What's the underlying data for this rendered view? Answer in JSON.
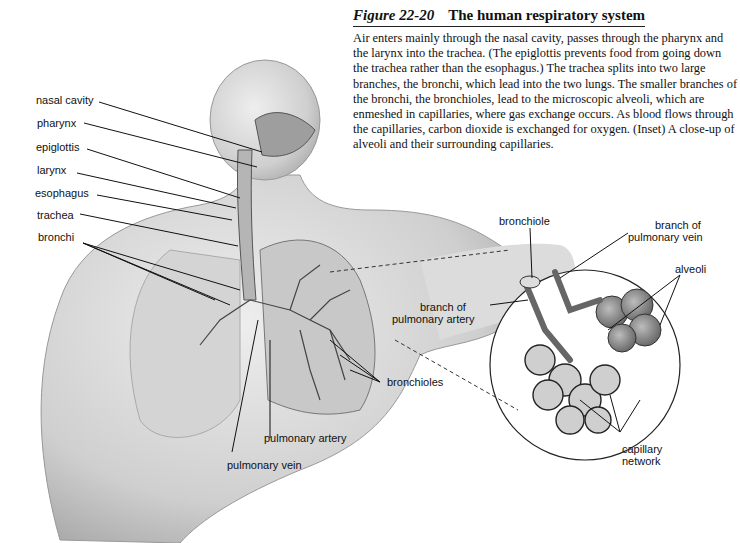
{
  "figure": {
    "number": "Figure 22-20",
    "title": "The human respiratory system",
    "caption": "Air enters mainly through the nasal cavity, passes through the pharynx and the larynx into the trachea. (The epiglottis prevents food from going down the trachea rather than the esophagus.) The trachea splits into two large branches, the bronchi, which lead into the two lungs. The smaller branches of the bronchi, the bronchioles, lead to the microscopic alveoli, which are enmeshed in capillaries, where gas exchange occurs. As blood flows through the capillaries, carbon dioxide is exchanged for oxygen. (Inset) A close-up of alveoli and their surrounding capillaries."
  },
  "labels": {
    "nasal_cavity": "nasal cavity",
    "pharynx": "pharynx",
    "epiglottis": "epiglottis",
    "larynx": "larynx",
    "esophagus": "esophagus",
    "trachea": "trachea",
    "bronchi": "bronchi",
    "bronchioles": "bronchioles",
    "pulmonary_artery": "pulmonary artery",
    "pulmonary_vein": "pulmonary vein"
  },
  "inset_labels": {
    "bronchiole": "bronchiole",
    "branch_pulmonary_vein_1": "branch of",
    "branch_pulmonary_vein_2": "pulmonary vein",
    "alveoli": "alveoli",
    "branch_pulmonary_artery_1": "branch of",
    "branch_pulmonary_artery_2": "pulmonary artery",
    "capillary_network_1": "capillary",
    "capillary_network_2": "network"
  }
}
